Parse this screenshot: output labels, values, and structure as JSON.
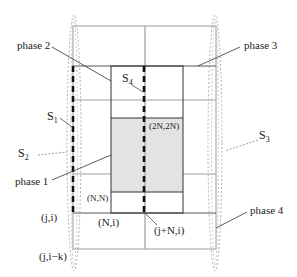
{
  "labels": {
    "phase1": "phase 1",
    "phase2": "phase 2",
    "phase3": "phase 3",
    "phase4": "phase 4",
    "s1": "S",
    "s1_sub": "1",
    "s2": "S",
    "s2_sub": "2",
    "s3": "S",
    "s3_sub": "3",
    "s4": "S",
    "s4_sub": "4",
    "nn": "(N,N)",
    "twoN": "(2N,2N)",
    "ji": "(j,i)",
    "Ni": "(N,i)",
    "jNi": "(j+N,i)",
    "jik": "(j,i−k)"
  },
  "colors": {
    "shade": "#e3e3e3",
    "dark_line": "#333333",
    "gray_line": "#aaaaaa",
    "dotted": "#999999"
  }
}
